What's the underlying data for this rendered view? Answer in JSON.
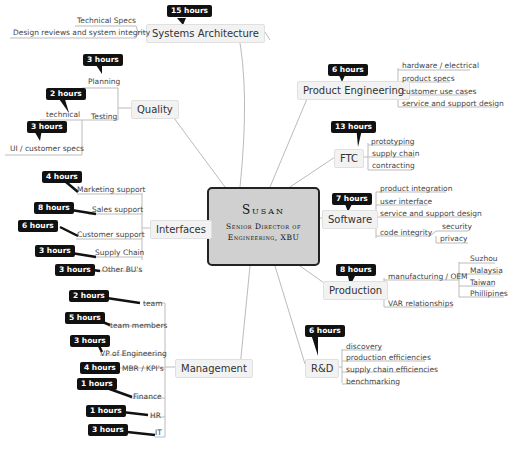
{
  "center": {
    "name": "Susan",
    "title_line1": "Senior Director of",
    "title_line2": "Engineering, XBU"
  },
  "branches": {
    "systems_architecture": {
      "label": "Systems Architecture",
      "hours": "15 hours",
      "children": [
        "Technical Specs",
        "Design reviews and system integrity"
      ]
    },
    "quality": {
      "label": "Quality",
      "children": {
        "planning": {
          "label": "Planning",
          "hours": "3 hours"
        },
        "testing": {
          "label": "Testing",
          "children": {
            "technical": {
              "label": "technical",
              "hours": "2 hours"
            },
            "ui_specs": {
              "label": "UI / customer specs",
              "hours": "3 hours"
            }
          }
        }
      }
    },
    "interfaces": {
      "label": "Interfaces",
      "children": [
        {
          "label": "Marketing support",
          "hours": "4 hours"
        },
        {
          "label": "Sales support",
          "hours": "8 hours"
        },
        {
          "label": "Customer support",
          "hours": "6 hours"
        },
        {
          "label": "Supply Chain",
          "hours": "3 hours"
        },
        {
          "label": "Other BU's",
          "hours": "3 hours"
        }
      ]
    },
    "management": {
      "label": "Management",
      "children": [
        {
          "label": "team",
          "hours": "2 hours"
        },
        {
          "label": "team members",
          "hours": "5 hours"
        },
        {
          "label": "VP of Engineering",
          "hours": "3 hours"
        },
        {
          "label": "MBR / KPI's",
          "hours": "4 hours"
        },
        {
          "label": "Finance",
          "hours": "1 hours"
        },
        {
          "label": "HR",
          "hours": "1 hours"
        },
        {
          "label": "IT",
          "hours": "3 hours"
        }
      ]
    },
    "product_engineering": {
      "label": "Product Engineering",
      "hours": "6 hours",
      "children": [
        "hardware / electrical",
        "product specs",
        "customer use cases",
        "service and support design"
      ]
    },
    "ftc": {
      "label": "FTC",
      "hours": "13 hours",
      "children": [
        "prototyping",
        "supply chain",
        "contracting"
      ]
    },
    "software": {
      "label": "Software",
      "hours": "7 hours",
      "children": [
        "product integration",
        "user interface",
        "service and support design",
        "code integrity"
      ],
      "code_integrity_children": [
        "security",
        "privacy"
      ]
    },
    "production": {
      "label": "Production",
      "hours": "8 hours",
      "manufacturing": "manufacturing / OEM",
      "manufacturing_children": [
        "Suzhou",
        "Malaysia",
        "Taiwan",
        "Phillipines"
      ],
      "var": "VAR relationships"
    },
    "rnd": {
      "label": "R&D",
      "hours": "6 hours",
      "children": [
        "discovery",
        "production efficiencies",
        "supply chain efficiencies",
        "benchmarking"
      ]
    }
  }
}
